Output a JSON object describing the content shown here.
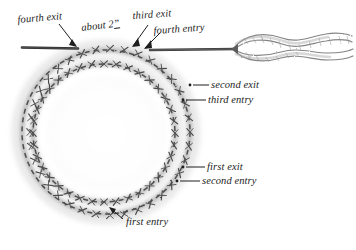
{
  "figure": {
    "medium": "pencil and ink illustration",
    "background_color": "#ffffff",
    "ink_color": "#3a3a3a",
    "label_color": "#1d1d1d"
  },
  "labels": {
    "fourth_exit": "fourth exit",
    "about_2": "about 2",
    "about_2_unit": "”",
    "third_exit": "third exit",
    "fourth_entry": "fourth entry",
    "second_exit": "second exit",
    "third_entry": "third entry",
    "first_exit": "first exit",
    "second_entry": "second entry",
    "first_entry": "first entry"
  },
  "parts": {
    "outer_ring": "outer-stitch-ring",
    "inner_ring": "inner-stitch-ring",
    "thread_tail": "thread-tail",
    "thread_loop": "twisted-thread-loop",
    "needle_point": "thread-point"
  }
}
